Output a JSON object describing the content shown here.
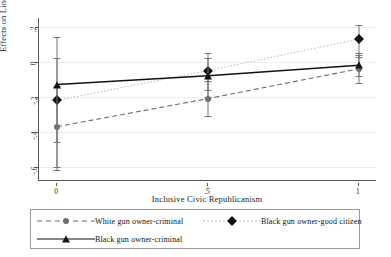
{
  "chart_data": {
    "type": "line",
    "title": "",
    "xlabel": "Inclusive Civic Republicanism",
    "ylabel": "Effects on Linear Prediction",
    "x": [
      0,
      0.5,
      1
    ],
    "xtick_labels": [
      "0",
      ".5",
      "1"
    ],
    "ytick_labels": [
      ".2",
      "0",
      "-.2",
      "-.4",
      "-.6"
    ],
    "ytick_values": [
      0.2,
      0,
      -0.2,
      -0.4,
      -0.6
    ],
    "ylim": [
      -0.68,
      0.25
    ],
    "xlim": [
      -0.06,
      1.06
    ],
    "grid": true,
    "legend_position": "below-plot",
    "series": [
      {
        "name": "White gun owner-criminal",
        "marker": "circle",
        "line_style": "dashed",
        "color": "#6e6e6e",
        "values": [
          -0.37,
          -0.21,
          -0.04
        ],
        "ci_low": [
          -0.6,
          -0.31,
          -0.12
        ],
        "ci_high": [
          -0.14,
          -0.11,
          0.04
        ]
      },
      {
        "name": "Black gun owner-good citizen",
        "marker": "diamond",
        "line_style": "dotted",
        "color": "#111111",
        "values": [
          -0.22,
          -0.05,
          0.13
        ],
        "ci_low": [
          -0.62,
          -0.16,
          0.03
        ],
        "ci_high": [
          0.14,
          0.05,
          0.21
        ]
      },
      {
        "name": "Black gun owner-criminal",
        "marker": "triangle",
        "line_style": "solid",
        "color": "#111111",
        "values": [
          -0.13,
          -0.08,
          -0.02
        ],
        "ci_low": [
          -0.46,
          -0.2,
          -0.08
        ],
        "ci_high": [
          0.02,
          0.02,
          0.05
        ]
      }
    ]
  },
  "legend": {
    "entries": [
      {
        "label": "White gun owner-criminal"
      },
      {
        "label": "Black gun owner-good citizen"
      },
      {
        "label": "Black gun owner-criminal"
      }
    ]
  },
  "axes": {
    "y_title": "Effects on Linear Prediction",
    "x_title": "Inclusive Civic Republicanism"
  }
}
